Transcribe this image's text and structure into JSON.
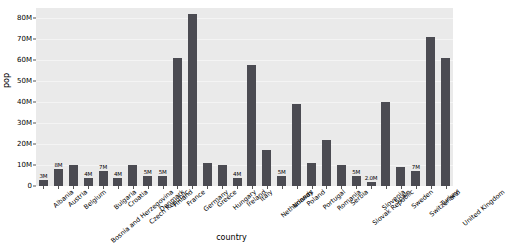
{
  "chart_data": {
    "type": "bar",
    "title": "",
    "xlabel": "country",
    "ylabel": "pop",
    "ylim": [
      0,
      85000000
    ],
    "grid": true,
    "legend": "none",
    "ytick_labels": [
      "0",
      "10M",
      "20M",
      "30M",
      "40M",
      "50M",
      "60M",
      "70M",
      "80M"
    ],
    "ytick_values": [
      0,
      10000000,
      20000000,
      30000000,
      40000000,
      50000000,
      60000000,
      70000000,
      80000000
    ],
    "categories": [
      "Albania",
      "Austria",
      "Belgium",
      "Bosnia and Herzegovina",
      "Bulgaria",
      "Croatia",
      "Czech Republic",
      "Denmark",
      "Finland",
      "France",
      "Germany",
      "Greece",
      "Hungary",
      "Ireland",
      "Italy",
      "Netherlands",
      "Norway",
      "Poland",
      "Portugal",
      "Romania",
      "Serbia",
      "Slovak Republic",
      "Slovenia",
      "Spain",
      "Sweden",
      "Switzerland",
      "Turkey",
      "United Kingdom"
    ],
    "values": [
      3000000,
      8000000,
      10000000,
      4000000,
      7000000,
      4000000,
      10000000,
      5000000,
      5000000,
      61000000,
      82000000,
      11000000,
      10000000,
      4000000,
      58000000,
      17000000,
      5000000,
      39000000,
      11000000,
      22000000,
      10000000,
      5000000,
      2000000,
      40000000,
      9000000,
      7000000,
      71000000,
      61000000
    ],
    "data_labels": [
      "3M",
      "8M",
      "10M",
      "4M",
      "7M",
      "4M",
      "10M",
      "5M",
      "5M",
      "61M",
      "82M",
      "11M",
      "10M",
      "4M",
      "58M",
      "17M",
      "5M",
      "39M",
      "11M",
      "22M",
      "10M",
      "5M",
      "2.0M",
      "40M",
      "9M",
      "7M",
      "71M",
      "61M"
    ],
    "bar_color": "#4b4b52",
    "plot_background": "#eaeaea",
    "grid_color": "#f4f4f4"
  }
}
